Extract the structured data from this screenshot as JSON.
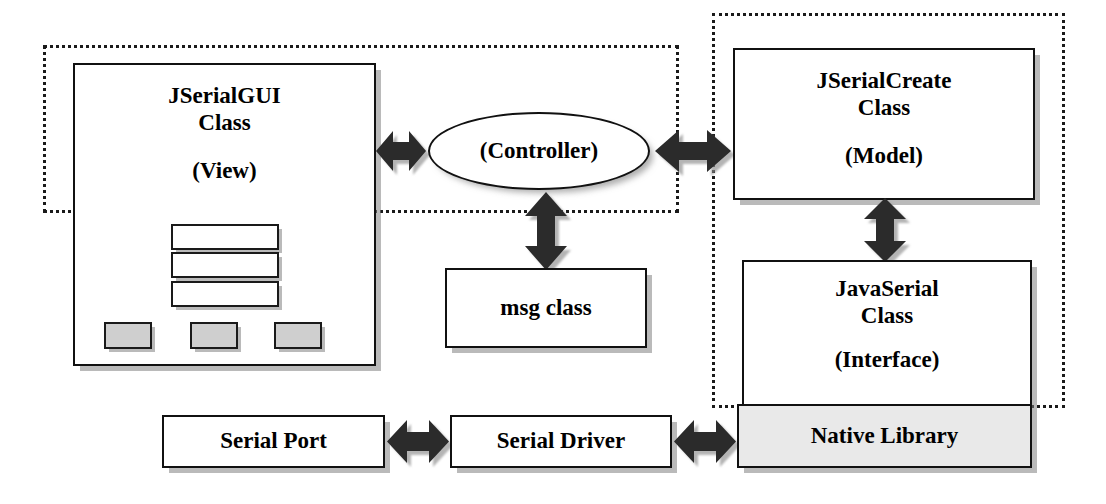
{
  "diagram": {
    "colors": {
      "stroke": "#111111",
      "fill_white": "#ffffff",
      "fill_gray_button": "#cfcfcf",
      "fill_gray_box": "#e9e9e9",
      "arrow_fill": "#2b2b2b",
      "shadow": "#8a8a8a"
    },
    "groups": [
      {
        "name": "client-side-group",
        "label": ""
      },
      {
        "name": "server-side-group",
        "label": ""
      }
    ],
    "nodes": {
      "jserialgui": {
        "title": "JSerialGUI",
        "subtitle_line2": "Class",
        "role": "(View)"
      },
      "controller": {
        "label": "(Controller)"
      },
      "jserialcreate": {
        "title": "JSerialCreate",
        "subtitle_line2": "Class",
        "role": "(Model)"
      },
      "javaserial": {
        "title": "JavaSerial",
        "subtitle_line2": "Class",
        "role": "(Interface)"
      },
      "msgclass": {
        "label": "msg class"
      },
      "serialport": {
        "label": "Serial Port"
      },
      "serialdriver": {
        "label": "Serial Driver"
      },
      "nativelibrary": {
        "label": "Native Library"
      }
    },
    "gui_mock": {
      "text_fields": [
        {
          "name": "text-field-1"
        },
        {
          "name": "text-field-2"
        },
        {
          "name": "text-field-3"
        }
      ],
      "buttons": [
        {
          "name": "gui-button-1"
        },
        {
          "name": "gui-button-2"
        },
        {
          "name": "gui-button-3"
        }
      ]
    },
    "connectors": [
      {
        "name": "gui-to-controller",
        "type": "double-arrow-horizontal"
      },
      {
        "name": "controller-to-model",
        "type": "double-arrow-horizontal"
      },
      {
        "name": "controller-to-msgclass",
        "type": "double-arrow-vertical"
      },
      {
        "name": "model-to-interface",
        "type": "double-arrow-vertical"
      },
      {
        "name": "serialport-to-serialdriver",
        "type": "double-arrow-horizontal"
      },
      {
        "name": "serialdriver-to-nativelibrary",
        "type": "double-arrow-horizontal"
      }
    ]
  }
}
